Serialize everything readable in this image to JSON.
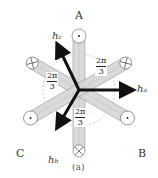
{
  "figure": {
    "caption": "(a)",
    "phases": [
      {
        "name": "A",
        "position": "top"
      },
      {
        "name": "B",
        "position": "bottom-right"
      },
      {
        "name": "C",
        "position": "bottom-left"
      }
    ],
    "vectors": [
      {
        "name": "h",
        "sub": "a",
        "direction": "right"
      },
      {
        "name": "h",
        "sub": "b",
        "direction": "down-left"
      },
      {
        "name": "h",
        "sub": "c",
        "direction": "up-left"
      }
    ],
    "angles": [
      {
        "num": "2π",
        "den": "3"
      },
      {
        "num": "2π",
        "den": "3"
      },
      {
        "num": "2π",
        "den": "3"
      }
    ],
    "colors": {
      "conductor_fill": "#d9d9d9",
      "conductor_stroke": "#888888",
      "arrow": "#111111"
    }
  }
}
